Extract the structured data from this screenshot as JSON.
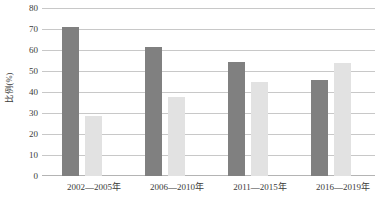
{
  "chart_data": {
    "type": "bar",
    "title": "",
    "subtitle": "",
    "xlabel": "",
    "ylabel": "比例(%)",
    "categories": [
      "2002—2005年",
      "2006—2010年",
      "2011—2015年",
      "2016—2019年"
    ],
    "series": [
      {
        "name": "series-1",
        "color": "#808080",
        "values": [
          71.0,
          61.6,
          54.3,
          45.5
        ]
      },
      {
        "name": "series-2",
        "color": "#e2e2e2",
        "values": [
          28.7,
          37.8,
          44.8,
          53.7
        ]
      }
    ],
    "ylim": [
      0,
      80
    ],
    "ytick_step": 10,
    "yticks": [
      "80",
      "70",
      "60",
      "50",
      "40",
      "30",
      "20",
      "10",
      "0"
    ],
    "grid": true,
    "grid_color": "#c8c8c8",
    "legend": false,
    "legend_position": "none",
    "background": "#ffffff"
  }
}
